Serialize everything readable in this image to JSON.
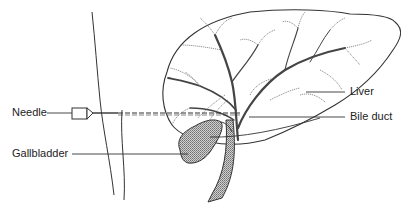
{
  "diagram": {
    "colors": {
      "stroke": "#333333",
      "fill_shaded": "#a8a8a8",
      "background": "#ffffff",
      "label_text": "#222222"
    },
    "labels": {
      "needle": "Needle",
      "gallbladder": "Gallbladder",
      "liver": "Liver",
      "bile_duct": "Bile duct"
    }
  }
}
